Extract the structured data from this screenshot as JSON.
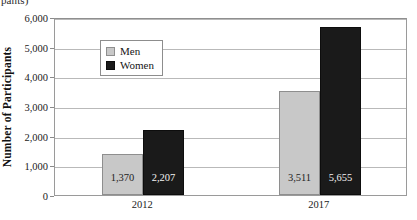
{
  "caption_fragment": "pants)",
  "chart_data": {
    "type": "bar",
    "title": "",
    "xlabel": "",
    "ylabel": "Number of Participants",
    "ylim": [
      0,
      6000
    ],
    "ytick_values": [
      0,
      1000,
      2000,
      3000,
      4000,
      5000,
      6000
    ],
    "ytick_labels": [
      "0",
      "1,000",
      "2,000",
      "3,000",
      "4,000",
      "5,000",
      "6,000"
    ],
    "categories": [
      "2012",
      "2017"
    ],
    "grid": "horizontal",
    "legend_position": "upper-left-inside",
    "series": [
      {
        "name": "Men",
        "color": "#c8c8c8",
        "values": [
          1370,
          3511
        ],
        "labels": [
          "1,370",
          "3,511"
        ]
      },
      {
        "name": "Women",
        "color": "#1a1a1a",
        "values": [
          2207,
          5655
        ],
        "labels": [
          "2,207",
          "5,655"
        ]
      }
    ]
  },
  "colors": {
    "men": "#c8c8c8",
    "women": "#1a1a1a",
    "gridline": "#b9b9b9",
    "axis": "#9a9a9a"
  }
}
